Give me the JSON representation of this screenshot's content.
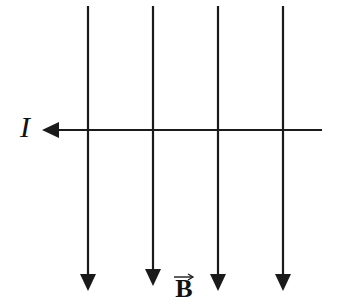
{
  "diagram": {
    "type": "physics-magnetic-field-current",
    "labels": {
      "current": "I",
      "field": "B"
    },
    "current_wire": {
      "direction": "left",
      "y": 130,
      "x_start": 322,
      "x_tip": 43
    },
    "field_lines": [
      {
        "x": 88,
        "y_top": 6,
        "y_tip": 290,
        "direction": "down"
      },
      {
        "x": 153,
        "y_top": 6,
        "y_tip": 285,
        "direction": "down"
      },
      {
        "x": 218,
        "y_top": 6,
        "y_tip": 290,
        "direction": "down"
      },
      {
        "x": 283,
        "y_top": 6,
        "y_tip": 290,
        "direction": "down"
      }
    ],
    "colors": {
      "stroke": "#1a1a1a",
      "background": "#ffffff"
    }
  }
}
